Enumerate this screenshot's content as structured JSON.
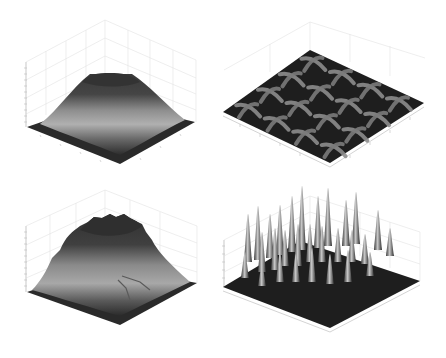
{
  "figure": {
    "background": "#ffffff",
    "colormap": "gray",
    "layout": "2x2 grid of 3D surface plots"
  },
  "chart_data": [
    {
      "type": "surface3d",
      "position": "top-left",
      "title": "",
      "xlabel": "",
      "ylabel": "",
      "zlabel": "",
      "description": "Single smooth flat-topped mound (plateau) centered on the domain",
      "shape": "plateau",
      "peaks": 1,
      "colors": {
        "base": "#2a2a2a",
        "mid": "#a9a9a9",
        "top": "#3a3a3a"
      },
      "grid": true
    },
    {
      "type": "surface3d",
      "position": "top-right",
      "title": "",
      "xlabel": "",
      "ylabel": "",
      "zlabel": "",
      "description": "Low periodic surface of 4x4 cross-shaped ridges on a flat dark floor",
      "shape": "periodic-cross-grid",
      "grid_rows": 4,
      "grid_cols": 4,
      "colors": {
        "base": "#1e1e1e",
        "ridge": "#8c8c8c"
      },
      "grid": true
    },
    {
      "type": "surface3d",
      "position": "bottom-left",
      "title": "",
      "xlabel": "",
      "ylabel": "",
      "zlabel": "",
      "description": "Noisy, irregular mound with a rough top and a step discontinuity on the front-right face",
      "shape": "noisy-plateau",
      "peaks": 1,
      "colors": {
        "base": "#2a2a2a",
        "mid": "#a0a0a0",
        "top": "#353535"
      },
      "grid": true
    },
    {
      "type": "surface3d",
      "position": "bottom-right",
      "title": "",
      "xlabel": "",
      "ylabel": "",
      "zlabel": "",
      "description": "Flat dark floor with many narrow tall spikes arranged in a rough grid",
      "shape": "spikes",
      "peaks": 30,
      "colors": {
        "base": "#1e1e1e",
        "spike": "#b5b5b5"
      },
      "grid": true
    }
  ]
}
